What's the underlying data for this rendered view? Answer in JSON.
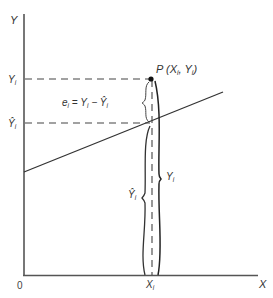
{
  "diagram": {
    "type": "regression-residual-illustration",
    "axes": {
      "y_label": "Y",
      "x_label": "X",
      "origin_label": "0"
    },
    "point": {
      "name": "P",
      "label": "P (X",
      "label_sub_x": "i",
      "label_mid": ", Y",
      "label_sub_y": "i",
      "label_end": ")"
    },
    "y_ticks": {
      "observed": {
        "base": "Y",
        "sub": "i"
      },
      "fitted": {
        "base": "Ŷ",
        "sub": "i"
      }
    },
    "x_tick": {
      "base": "X",
      "sub": "i"
    },
    "residual_equation": {
      "e": "e",
      "e_sub": "i",
      "equals": " = ",
      "y": "Y",
      "y_sub": "i",
      "minus": " − ",
      "yhat": "Ŷ",
      "yhat_sub": "i"
    },
    "braces": {
      "fitted": {
        "base": "Ŷ",
        "sub": "i"
      },
      "observed": {
        "base": "Y",
        "sub": "i"
      }
    },
    "colors": {
      "line": "#333333",
      "axis": "#555555",
      "text": "#333333"
    }
  }
}
